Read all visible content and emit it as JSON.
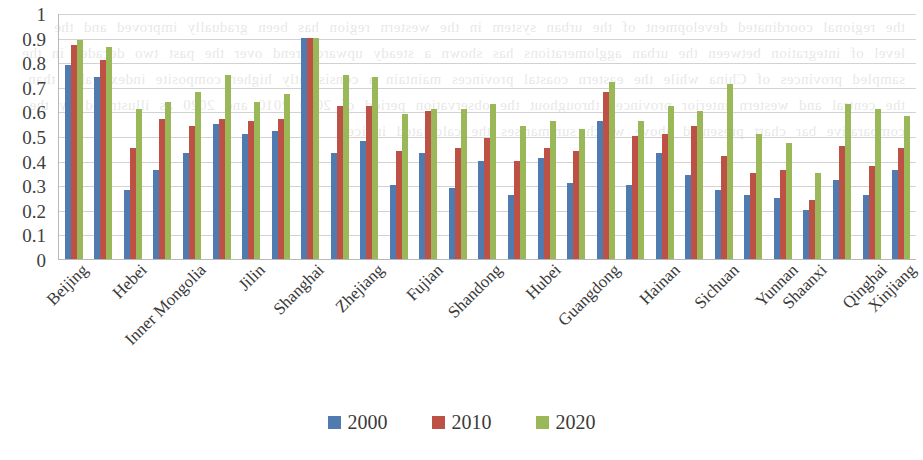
{
  "chart_data": {
    "type": "bar",
    "title": "",
    "xlabel": "",
    "ylabel": "",
    "ylim": [
      0,
      1
    ],
    "ytick_values": [
      0,
      0.1,
      0.2,
      0.3,
      0.4,
      0.5,
      0.6,
      0.7,
      0.8,
      0.9,
      1
    ],
    "ytick_labels": [
      "0",
      "0.1",
      "0.2",
      "0.3",
      "0.4",
      "0.5",
      "0.6",
      "0.7",
      "0.8",
      "0.9",
      "1"
    ],
    "grid": true,
    "legend_position": "bottom",
    "categories": [
      "Beijing",
      "Tianjin",
      "Hebei",
      "Shanxi",
      "Inner Mongolia",
      "Liaoning",
      "Jilin",
      "Heilongjiang",
      "Shanghai",
      "Jiangsu",
      "Zhejiang",
      "Anhui",
      "Fujian",
      "Jiangxi",
      "Shandong",
      "Henan",
      "Hubei",
      "Hunan",
      "Guangdong",
      "Guangxi",
      "Hainan",
      "Chongqing",
      "Sichuan",
      "Guizhou",
      "Yunnan",
      "Shaanxi",
      "Gansu",
      "Qinghai",
      "Xinjiang"
    ],
    "visible_tick_labels": [
      "Beijing",
      "Hebei",
      "Inner Mongolia",
      "Jilin",
      "Shanghai",
      "Zhejiang",
      "Fujian",
      "Shandong",
      "Hubei",
      "Guangdong",
      "Hainan",
      "Sichuan",
      "Yunnan",
      "Shaanxi",
      "Qinghai",
      "Xinjiang"
    ],
    "series": [
      {
        "name": "2000",
        "color": "#4f7bb0",
        "values": [
          0.79,
          0.74,
          0.28,
          0.36,
          0.43,
          0.55,
          0.51,
          0.52,
          0.9,
          0.43,
          0.48,
          0.3,
          0.43,
          0.29,
          0.4,
          0.26,
          0.41,
          0.31,
          0.56,
          0.3,
          0.43,
          0.34,
          0.28,
          0.26,
          0.25,
          0.2,
          0.32,
          0.26,
          0.36
        ]
      },
      {
        "name": "2010",
        "color": "#bd5146",
        "values": [
          0.87,
          0.81,
          0.45,
          0.57,
          0.54,
          0.57,
          0.56,
          0.57,
          0.9,
          0.62,
          0.62,
          0.44,
          0.6,
          0.45,
          0.49,
          0.4,
          0.45,
          0.44,
          0.68,
          0.5,
          0.51,
          0.54,
          0.42,
          0.35,
          0.36,
          0.24,
          0.46,
          0.38,
          0.45
        ]
      },
      {
        "name": "2020",
        "color": "#9ab857",
        "values": [
          0.89,
          0.86,
          0.61,
          0.64,
          0.68,
          0.75,
          0.64,
          0.67,
          0.9,
          0.75,
          0.74,
          0.59,
          0.61,
          0.61,
          0.63,
          0.54,
          0.56,
          0.53,
          0.72,
          0.56,
          0.62,
          0.6,
          0.71,
          0.51,
          0.47,
          0.35,
          0.63,
          0.61,
          0.58
        ]
      }
    ],
    "third_series_extra": [
      0.52,
      0.65,
      0.58
    ]
  },
  "legend": {
    "items": [
      {
        "label": "2000",
        "color": "#4f7bb0"
      },
      {
        "label": "2010",
        "color": "#bd5146"
      },
      {
        "label": "2020",
        "color": "#9ab857"
      }
    ]
  },
  "page": {
    "bleed_text": "the regional coordinated development of the urban system in the western region has been gradually improved and the level of integration between the urban agglomerations has shown a steady upward trend over the past two decades in the sampled provinces of China while the eastern coastal provinces maintain a consistently higher composite index value than the central and western interior provinces throughout the observation period of 2000 2010 and 2020 as illustrated by the comparative bar chart presented above which summarises the calculated indices"
  }
}
